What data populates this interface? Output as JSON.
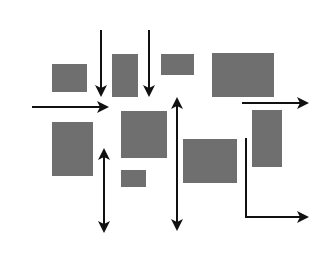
{
  "diagram": {
    "type": "layout-blocks-with-flow-arrows",
    "colors": {
      "background": "#ffffff",
      "block": "#6f6f6f",
      "arrow": "#111111"
    },
    "blocks": [
      {
        "id": "block-a",
        "x": 52,
        "y": 64,
        "w": 35,
        "h": 28
      },
      {
        "id": "block-b",
        "x": 112,
        "y": 54,
        "w": 26,
        "h": 43
      },
      {
        "id": "block-c",
        "x": 161,
        "y": 54,
        "w": 33,
        "h": 21
      },
      {
        "id": "block-d",
        "x": 212,
        "y": 53,
        "w": 62,
        "h": 44
      },
      {
        "id": "block-e",
        "x": 52,
        "y": 122,
        "w": 41,
        "h": 54
      },
      {
        "id": "block-f",
        "x": 121,
        "y": 111,
        "w": 46,
        "h": 47
      },
      {
        "id": "block-g",
        "x": 121,
        "y": 170,
        "w": 25,
        "h": 17
      },
      {
        "id": "block-h",
        "x": 183,
        "y": 139,
        "w": 54,
        "h": 44
      },
      {
        "id": "block-i",
        "x": 252,
        "y": 110,
        "w": 30,
        "h": 57
      }
    ],
    "arrows": [
      {
        "id": "arrow-down-1",
        "kind": "single",
        "points": [
          [
            101,
            30
          ],
          [
            101,
            95
          ]
        ]
      },
      {
        "id": "arrow-down-2",
        "kind": "single",
        "points": [
          [
            149,
            30
          ],
          [
            149,
            95
          ]
        ]
      },
      {
        "id": "arrow-right-left",
        "kind": "single",
        "points": [
          [
            32,
            107
          ],
          [
            107,
            107
          ]
        ]
      },
      {
        "id": "arrow-right-top",
        "kind": "single",
        "points": [
          [
            242,
            103
          ],
          [
            307,
            103
          ]
        ]
      },
      {
        "id": "arrow-vertical-left",
        "kind": "double",
        "points": [
          [
            104,
            150
          ],
          [
            104,
            231
          ]
        ]
      },
      {
        "id": "arrow-vertical-mid",
        "kind": "double",
        "points": [
          [
            177,
            99
          ],
          [
            177,
            229
          ]
        ]
      },
      {
        "id": "arrow-elbow",
        "kind": "single",
        "points": [
          [
            246,
            138
          ],
          [
            246,
            217
          ],
          [
            307,
            217
          ]
        ]
      }
    ]
  }
}
